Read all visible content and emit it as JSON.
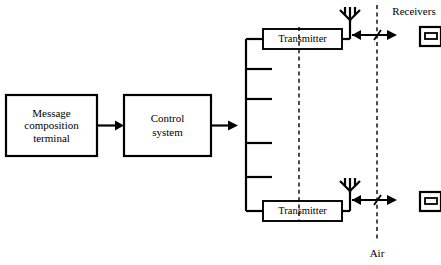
{
  "diagram": {
    "blocks": [
      {
        "id": "message-composition-terminal",
        "label_line1": "Message",
        "label_line2": "composition",
        "label_line3": "terminal"
      },
      {
        "id": "control-system",
        "label_line1": "Control",
        "label_line2": "system"
      }
    ],
    "transmitters": [
      {
        "id": "transmitter-top",
        "label": "Transmitter"
      },
      {
        "id": "transmitter-bottom",
        "label": "Transmitter"
      }
    ],
    "annotations": {
      "receivers_label": "Receivers",
      "air_label": "Air"
    },
    "bus": {
      "stub_count": 6,
      "note": "vertical distribution bus with horizontal branch stubs"
    },
    "icons": {
      "antenna": "antenna-icon",
      "receiver": "receiver-icon",
      "arrow": "arrow-icon"
    },
    "colors": {
      "stroke": "#000000",
      "background": "#ffffff"
    }
  }
}
